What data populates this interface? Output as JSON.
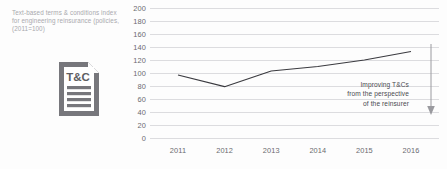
{
  "caption": {
    "line1": "Text-based terms & conditions index",
    "line2": "for engineering reinsurance (policies,",
    "line3": "(2011=100)"
  },
  "icon": {
    "name": "document-icon",
    "label": "T&C"
  },
  "annotation": {
    "line1": "Improving T&Cs",
    "line2": "from the perspective",
    "line3": "of the reinsurer"
  },
  "colors": {
    "line": "#3a3a3f",
    "grid": "#dcdcdf",
    "tick_text": "#6b6b70",
    "caption_text": "#a9a9ad",
    "icon": "#77777c",
    "arrow": "#9a9a9f"
  },
  "chart_data": {
    "type": "line",
    "title": "",
    "xlabel": "",
    "ylabel": "",
    "categories": [
      "2011",
      "2012",
      "2013",
      "2014",
      "2015",
      "2016"
    ],
    "values": [
      97,
      79,
      103,
      110,
      120,
      133
    ],
    "yticks": [
      200,
      180,
      160,
      140,
      120,
      100,
      80,
      60,
      40,
      20,
      0
    ],
    "ylim": [
      0,
      200
    ],
    "grid": true,
    "legend": "none",
    "annotations": [
      "Improving T&Cs",
      "from the perspective",
      "of the reinsurer"
    ]
  }
}
